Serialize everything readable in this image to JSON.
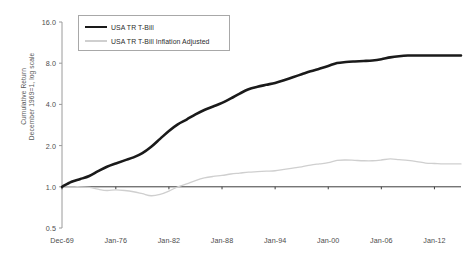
{
  "chart_data": {
    "type": "line",
    "title": "",
    "xlabel": "",
    "ylabel": "Cumulative Return December 1969=1, log scale",
    "ylabel_line1": "Cumulative Return",
    "ylabel_line2": "December 1969=1, log scale",
    "yscale": "log",
    "ylim": [
      0.5,
      16.0
    ],
    "ytick_labels": [
      "16.0",
      "8.0",
      "4.0",
      "2.0",
      "1.0",
      "0.5"
    ],
    "ytick_values": [
      16.0,
      8.0,
      4.0,
      2.0,
      1.0,
      0.5
    ],
    "xtick_labels": [
      "Dec-69",
      "Jan-76",
      "Jan-82",
      "Jan-88",
      "Jan-94",
      "Jan-00",
      "Jan-06",
      "Jan-12"
    ],
    "xtick_years": [
      1969.92,
      1976.0,
      1982.0,
      1988.0,
      1994.0,
      2000.0,
      2006.0,
      2012.0
    ],
    "xlim": [
      1969.92,
      2015.0
    ],
    "grid": false,
    "legend_position": "top-left",
    "colors": {
      "series_tbill": "#1a1a1a",
      "series_tbill_real": "#cfcfcf",
      "axis": "#9a9a9a",
      "baseline": "#3d3d3d",
      "text": "#4d4d4d",
      "background": "#ffffff",
      "legend_border": "#a8a8a8"
    },
    "series": [
      {
        "name": "USA TR T-Bill",
        "color": "#1a1a1a",
        "line_width": 2.6,
        "x": [
          1969.92,
          1971,
          1972,
          1973,
          1974,
          1975,
          1976,
          1977,
          1978,
          1979,
          1980,
          1981,
          1982,
          1983,
          1984,
          1985,
          1986,
          1987,
          1988,
          1989,
          1990,
          1991,
          1992,
          1993,
          1994,
          1995,
          1996,
          1997,
          1998,
          1999,
          2000,
          2001,
          2002,
          2003,
          2004,
          2005,
          2006,
          2007,
          2008,
          2009,
          2010,
          2011,
          2012,
          2013,
          2014,
          2015
        ],
        "values": [
          1.0,
          1.09,
          1.14,
          1.2,
          1.3,
          1.4,
          1.48,
          1.56,
          1.64,
          1.76,
          1.96,
          2.24,
          2.56,
          2.86,
          3.1,
          3.38,
          3.64,
          3.86,
          4.1,
          4.42,
          4.8,
          5.16,
          5.38,
          5.56,
          5.74,
          6.0,
          6.32,
          6.64,
          6.98,
          7.3,
          7.64,
          8.02,
          8.16,
          8.24,
          8.3,
          8.38,
          8.55,
          8.82,
          9.0,
          9.1,
          9.1,
          9.1,
          9.1,
          9.1,
          9.1,
          9.1
        ]
      },
      {
        "name": "USA TR T-Bill Inflation Adjusted",
        "color": "#cfcfcf",
        "line_width": 1.3,
        "x": [
          1969.92,
          1971,
          1972,
          1973,
          1974,
          1975,
          1976,
          1977,
          1978,
          1979,
          1980,
          1981,
          1982,
          1983,
          1984,
          1985,
          1986,
          1987,
          1988,
          1989,
          1990,
          1991,
          1992,
          1993,
          1994,
          1995,
          1996,
          1997,
          1998,
          1999,
          2000,
          2001,
          2002,
          2003,
          2004,
          2005,
          2006,
          2007,
          2008,
          2009,
          2010,
          2011,
          2012,
          2013,
          2014,
          2015
        ],
        "values": [
          1.0,
          1.0,
          1.0,
          0.99,
          0.96,
          0.94,
          0.95,
          0.94,
          0.92,
          0.89,
          0.86,
          0.88,
          0.93,
          1.0,
          1.05,
          1.11,
          1.16,
          1.19,
          1.21,
          1.24,
          1.26,
          1.28,
          1.29,
          1.3,
          1.31,
          1.34,
          1.37,
          1.4,
          1.44,
          1.47,
          1.5,
          1.56,
          1.57,
          1.56,
          1.55,
          1.55,
          1.57,
          1.6,
          1.58,
          1.56,
          1.53,
          1.49,
          1.48,
          1.47,
          1.47,
          1.47
        ]
      }
    ],
    "baseline_value": 1.0
  },
  "legend": {
    "items": [
      {
        "label": "USA TR T-Bill",
        "swatch": "thick-black-line"
      },
      {
        "label": "USA TR T-Bill Inflation Adjusted",
        "swatch": "thin-gray-line"
      }
    ]
  }
}
